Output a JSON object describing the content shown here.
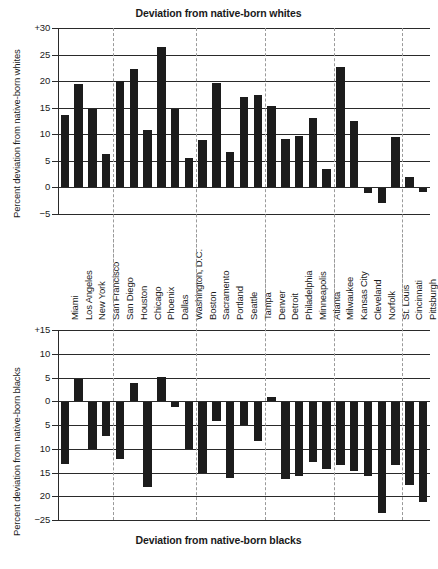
{
  "chart_data": [
    {
      "type": "bar",
      "title": "Deviation from native-born whites",
      "ylabel": "Percent deviation from native-born whites",
      "xlabel": "",
      "ylim": [
        -5,
        30
      ],
      "yticks": [
        "+30",
        "25",
        "20",
        "15",
        "10",
        "5",
        "0",
        "−5"
      ],
      "ytick_values": [
        30,
        25,
        20,
        15,
        10,
        5,
        0,
        -5
      ],
      "grid": true,
      "legend": "none",
      "categories": [
        "Miami",
        "Los Angeles",
        "New York",
        "San Francisco",
        "San Diego",
        "Houston",
        "Chicago",
        "Phoenix",
        "Dallas",
        "Washington, D.C.",
        "Boston",
        "Sacramento",
        "Portland",
        "Seattle",
        "Tampa",
        "Denver",
        "Detroit",
        "Philadelphia",
        "Minneapolis",
        "Atlanta",
        "Milwaukee",
        "Kansas City",
        "Cleveland",
        "Norfolk",
        "St. Louis",
        "Cincinnati",
        "Pittsburgh"
      ],
      "values": [
        13.6,
        19.4,
        14.7,
        6.3,
        20.0,
        22.3,
        10.8,
        26.4,
        14.7,
        5.6,
        9.0,
        19.7,
        6.6,
        17.0,
        17.4,
        15.4,
        9.1,
        9.6,
        13.1,
        3.4,
        22.7,
        12.5,
        -1.1,
        -2.9,
        9.5,
        1.9,
        -0.8
      ],
      "group_dividers_after": [
        "San Francisco",
        "Washington, D.C.",
        "Tampa",
        "Atlanta",
        "St. Louis"
      ]
    },
    {
      "type": "bar",
      "title": "Deviation from native-born blacks",
      "ylabel": "Percent deviation from native-born blacks",
      "xlabel": "",
      "ylim": [
        -25,
        15
      ],
      "yticks": [
        "+15",
        "10",
        "5",
        "0",
        "5",
        "10",
        "15",
        "20",
        "−25"
      ],
      "ytick_values": [
        15,
        10,
        5,
        0,
        -5,
        -10,
        -15,
        -20,
        -25
      ],
      "grid": true,
      "legend": "none",
      "categories": [
        "Miami",
        "Los Angeles",
        "New York",
        "San Francisco",
        "San Diego",
        "Houston",
        "Chicago",
        "Phoenix",
        "Dallas",
        "Washington, D.C.",
        "Boston",
        "Sacramento",
        "Portland",
        "Seattle",
        "Tampa",
        "Denver",
        "Detroit",
        "Philadelphia",
        "Minneapolis",
        "Atlanta",
        "Milwaukee",
        "Kansas City",
        "Cleveland",
        "Norfolk",
        "St. Louis",
        "Cincinnati",
        "Pittsburgh"
      ],
      "values": [
        -13.3,
        4.6,
        -10.0,
        -7.3,
        -12.1,
        3.8,
        -18.1,
        5.2,
        -1.3,
        -10.0,
        -15.2,
        -4.1,
        -16.1,
        -5.0,
        -8.4,
        1.0,
        -16.4,
        -15.8,
        -12.7,
        -14.2,
        -13.4,
        -14.6,
        -15.7,
        -23.5,
        -13.4,
        -17.6,
        -21.2
      ],
      "group_dividers_after": [
        "San Francisco",
        "Washington, D.C.",
        "Tampa",
        "Atlanta",
        "St. Louis"
      ]
    }
  ],
  "colors": {
    "bar": "#1c1c1c",
    "axis": "#2a2a2a",
    "divider": "#9a9a9a",
    "background": "#ffffff"
  }
}
